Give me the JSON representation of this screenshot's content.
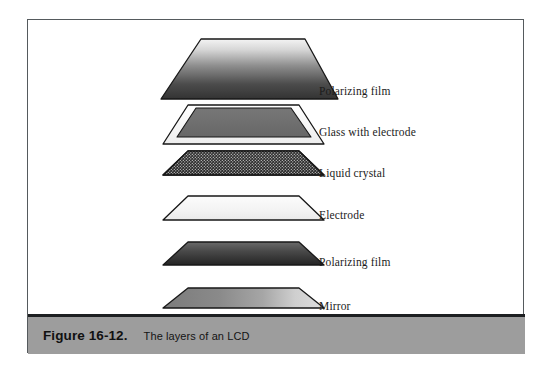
{
  "figure": {
    "number_label": "Figure 16-12.",
    "caption": "The layers of an LCD",
    "caption_bar_color": "#9d9d9d",
    "frame_color": "#555a5d",
    "background_color": "#ffffff"
  },
  "diagram": {
    "type": "exploded-layer-stack",
    "orientation": "top-to-bottom stacked trapezoids in perspective",
    "layers": [
      {
        "index": 0,
        "label": "Polarizing film",
        "fill_description": "vertical gradient light-to-dark gray",
        "fill_top": "#f2f2f2",
        "fill_bottom": "#3a3a3a",
        "stroke": "#1a1a1a"
      },
      {
        "index": 1,
        "label": "Glass with electrode",
        "fill_description": "white glass plate with inset medium-gray electrode panel",
        "fill_top": "#ffffff",
        "fill_bottom": "#eeeeee",
        "inset_fill": "#6e6e6e",
        "stroke": "#1a1a1a"
      },
      {
        "index": 2,
        "label": "Liquid crystal",
        "fill_description": "dark panel with fine dotted crystal texture",
        "fill_top": "#303030",
        "fill_bottom": "#2a2a2a",
        "pattern": "fine-dot-grid",
        "pattern_color": "#e8e8e8",
        "stroke": "#1a1a1a"
      },
      {
        "index": 3,
        "label": "Electrode",
        "fill_description": "very light near-white panel with subtle gradient",
        "fill_top": "#fbfbfb",
        "fill_bottom": "#ececec",
        "stroke": "#1a1a1a"
      },
      {
        "index": 4,
        "label": "Polarizing film",
        "fill_description": "vertical gradient medium-to-dark gray",
        "fill_top": "#5f5f5f",
        "fill_bottom": "#272727",
        "stroke": "#1a1a1a"
      },
      {
        "index": 5,
        "label": "Mirror",
        "fill_description": "horizontal gradient medium gray to light gray (reflective sheen)",
        "fill_left": "#7e7e7e",
        "fill_right": "#d8d8d8",
        "stroke": "#1a1a1a"
      }
    ]
  }
}
